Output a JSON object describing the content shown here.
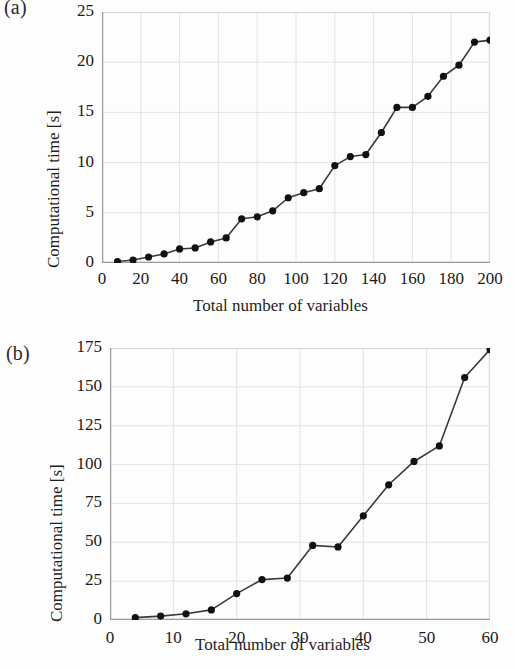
{
  "figure": {
    "panels": [
      {
        "label": "(a)",
        "ylabel": "Computational time [s]",
        "xlabel": "Total number of variables"
      },
      {
        "label": "(b)",
        "ylabel": "Computational time [s]",
        "xlabel": "Total number of variables"
      }
    ]
  },
  "style": {
    "line_color": "#3a3a3a",
    "marker_color": "#111111",
    "grid_color": "#e2e2e2",
    "frame_color": "#d8d8d8",
    "background": "#fdfdfd"
  },
  "chart_data": [
    {
      "type": "line",
      "panel": "(a)",
      "title": "",
      "xlabel": "Total number of variables",
      "ylabel": "Computational time [s]",
      "xlim": [
        0,
        200
      ],
      "ylim": [
        0,
        25
      ],
      "xticks": [
        0,
        20,
        40,
        60,
        80,
        100,
        120,
        140,
        160,
        180,
        200
      ],
      "xticklabels": [
        "0",
        "20",
        "40",
        "60",
        "80",
        "100",
        "120",
        "140",
        "160",
        "180",
        "200"
      ],
      "yticks": [
        0,
        5,
        10,
        15,
        20,
        25
      ],
      "yticklabels": [
        "0",
        "5",
        "10",
        "15",
        "20",
        "25"
      ],
      "grid": true,
      "legend": "none",
      "markers": "filled-circle",
      "x": [
        8,
        16,
        24,
        32,
        40,
        48,
        56,
        64,
        72,
        80,
        88,
        96,
        104,
        112,
        120,
        128,
        136,
        144,
        152,
        160,
        168,
        176,
        184,
        192,
        200
      ],
      "y": [
        0.15,
        0.3,
        0.6,
        0.9,
        1.4,
        1.5,
        2.1,
        2.5,
        4.4,
        4.6,
        5.2,
        6.5,
        7.0,
        7.4,
        9.7,
        10.6,
        10.8,
        13.0,
        15.5,
        15.5,
        16.6,
        18.6,
        19.7,
        22.0,
        22.2
      ]
    },
    {
      "type": "line",
      "panel": "(b)",
      "title": "",
      "xlabel": "Total number of variables",
      "ylabel": "Computational time [s]",
      "xlim": [
        0,
        60
      ],
      "ylim": [
        0,
        175
      ],
      "xticks": [
        0,
        10,
        20,
        30,
        40,
        50,
        60
      ],
      "xticklabels": [
        "0",
        "10",
        "20",
        "30",
        "40",
        "50",
        "60"
      ],
      "yticks": [
        0,
        25,
        50,
        75,
        100,
        125,
        150,
        175
      ],
      "yticklabels": [
        "0",
        "25",
        "50",
        "75",
        "100",
        "125",
        "150",
        "175"
      ],
      "grid": true,
      "legend": "none",
      "markers": "filled-circle",
      "x": [
        4,
        8,
        12,
        16,
        20,
        24,
        28,
        32,
        36,
        40,
        44,
        48,
        52,
        56,
        60
      ],
      "y": [
        1.5,
        2.5,
        4.0,
        6.5,
        17.0,
        26.0,
        27.0,
        48.0,
        47.0,
        67.0,
        87.0,
        102.0,
        112.0,
        156.0,
        174.0
      ]
    }
  ]
}
